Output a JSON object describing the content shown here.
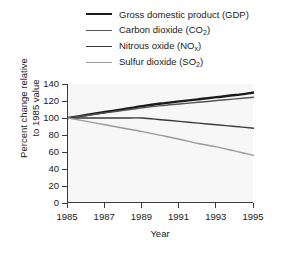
{
  "chart_data": {
    "type": "line",
    "title": "",
    "xlabel": "Year",
    "ylabel_line1": "Percent change relative",
    "ylabel_line2": "to 1985 value",
    "xlim": [
      1985,
      1995
    ],
    "ylim": [
      0,
      140
    ],
    "xticks": [
      1985,
      1987,
      1989,
      1991,
      1993,
      1995
    ],
    "yticks": [
      0,
      20,
      40,
      60,
      80,
      100,
      120,
      140
    ],
    "grid": false,
    "legend_position": "top",
    "plot_background": "#f7f7f7",
    "axis_color": "#3a3a3a",
    "x": [
      1985,
      1986,
      1987,
      1988,
      1989,
      1990,
      1991,
      1992,
      1993,
      1994,
      1995
    ],
    "series": [
      {
        "name": "Gross domestic product (GDP)",
        "short": "GDP",
        "color": "#1a1a1a",
        "width": 2.4,
        "values": [
          100,
          103.5,
          107,
          110.5,
          114,
          117,
          119.5,
          122,
          124.5,
          127,
          130
        ]
      },
      {
        "name": "Carbon dioxide (CO2)",
        "short": "CO2",
        "color": "#555555",
        "width": 1.4,
        "values": [
          100,
          103,
          106,
          109,
          112,
          114.5,
          116.5,
          118.5,
          120.5,
          122.5,
          124.5
        ]
      },
      {
        "name": "Nitrous oxide (NOx)",
        "short": "NOx",
        "color": "#3a3a3a",
        "width": 1.4,
        "values": [
          100,
          100,
          100,
          100,
          100,
          98,
          96,
          94,
          92,
          90,
          88
        ]
      },
      {
        "name": "Sulfur dioxide (SO2)",
        "short": "SO2",
        "color": "#9a9a9a",
        "width": 1.4,
        "values": [
          100,
          96,
          92,
          88,
          84,
          79.5,
          75,
          70,
          66,
          61,
          56
        ]
      }
    ]
  },
  "legend": {
    "items": [
      {
        "label_main": "Gross domestic product (GDP)",
        "label_pre": "Gross domestic product (GDP)",
        "sub": "",
        "label_post": "",
        "color": "#1a1a1a",
        "thickness": "2.4px"
      },
      {
        "label_main": "Carbon dioxide (CO2)",
        "label_pre": "Carbon dioxide (CO",
        "sub": "2",
        "label_post": ")",
        "color": "#555555",
        "thickness": "1.4px"
      },
      {
        "label_main": "Nitrous oxide (NOx)",
        "label_pre": "Nitrous oxide (NO",
        "sub": "x",
        "label_post": ")",
        "color": "#3a3a3a",
        "thickness": "1.6px"
      },
      {
        "label_main": "Sulfur dioxide (SO2)",
        "label_pre": "Sulfur dioxide (SO",
        "sub": "2",
        "label_post": ")",
        "color": "#9a9a9a",
        "thickness": "1.4px"
      }
    ]
  },
  "axes": {
    "ytick_labels": [
      "140",
      "120",
      "100",
      "80",
      "60",
      "40",
      "20",
      "0"
    ],
    "xtick_labels": [
      "1985",
      "1987",
      "1989",
      "1991",
      "1993",
      "1995"
    ],
    "ylabel_line1": "Percent change relative",
    "ylabel_line2": "to 1985 value",
    "xlabel": "Year"
  }
}
